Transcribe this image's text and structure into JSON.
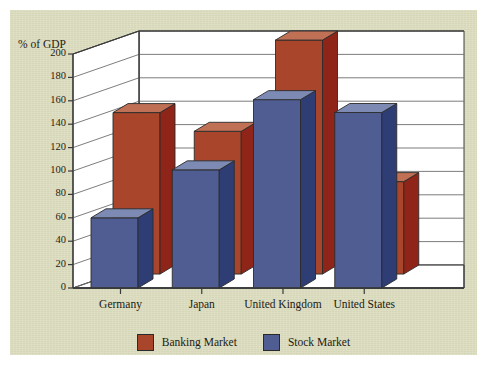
{
  "chart_data": {
    "type": "bar",
    "title": "",
    "subtitle": "",
    "xlabel": "",
    "ylabel": "% of GDP",
    "ylim": [
      0,
      200
    ],
    "ytick_step": 20,
    "yticks": [
      0,
      20,
      40,
      60,
      80,
      100,
      120,
      140,
      160,
      180,
      200
    ],
    "grid": true,
    "projection": "3d",
    "legend_position": "bottom",
    "categories": [
      "Germany",
      "Japan",
      "United Kingdom",
      "United States"
    ],
    "series": [
      {
        "name": "Banking Market",
        "color": "#a8452a",
        "values": [
          138,
          122,
          200,
          79
        ]
      },
      {
        "name": "Stock Market",
        "color": "#4f5d92",
        "values": [
          60,
          101,
          161,
          150
        ]
      }
    ]
  },
  "axis": {
    "y_title": "% of GDP",
    "tick_labels": [
      "200",
      "180",
      "160",
      "140",
      "120",
      "100",
      "80",
      "60",
      "40",
      "20",
      "0"
    ]
  },
  "categories": {
    "labels": [
      "Germany",
      "Japan",
      "United Kingdom",
      "United States"
    ]
  },
  "legend": {
    "items": [
      {
        "label": "Banking Market",
        "color": "#a8452a"
      },
      {
        "label": "Stock Market",
        "color": "#4f5d92"
      }
    ]
  },
  "colors": {
    "card_background": "#dcdcbe",
    "page_background": "#ffffff",
    "plot_background": "#ffffff",
    "banking_front": "#a8452a",
    "banking_side": "#8f2418",
    "banking_top": "#c07055",
    "stock_front": "#4f5d92",
    "stock_side": "#2e3e75",
    "stock_top": "#7c8ab4",
    "axis_line": "#3a3a3a",
    "grid_line": "#6e6e6e",
    "text": "#1d1b14"
  }
}
